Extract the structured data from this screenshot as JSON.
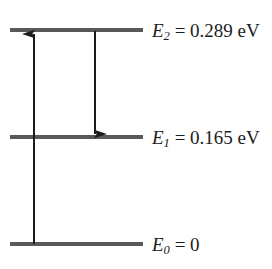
{
  "figure": {
    "type": "energy-level-diagram",
    "background_color": "#ffffff",
    "line_color": "#595959",
    "text_color": "#1c1c1c"
  },
  "levels": [
    {
      "id": "E2",
      "symbol": "E",
      "subscript": "2",
      "equals": "=",
      "value": "0.289",
      "unit": "eV",
      "label": "E2 = 0.289 eV",
      "energy_eV": 0.289,
      "y": 30
    },
    {
      "id": "E1",
      "symbol": "E",
      "subscript": "1",
      "equals": "=",
      "value": "0.165",
      "unit": "eV",
      "label": "E1 = 0.165 eV",
      "energy_eV": 0.165,
      "y": 137
    },
    {
      "id": "E0",
      "symbol": "E",
      "subscript": "0",
      "equals": "=",
      "value": "0",
      "unit": "",
      "label": "E0 = 0",
      "energy_eV": 0,
      "y": 244
    }
  ],
  "transitions": [
    {
      "id": "absorption",
      "direction": "up",
      "from_level": "E0",
      "to_level": "E2",
      "x": 34,
      "y_start": 244,
      "y_end": 32
    },
    {
      "id": "emission",
      "direction": "down",
      "from_level": "E2",
      "to_level": "E1",
      "x": 95,
      "y_start": 31,
      "y_end": 136
    }
  ]
}
